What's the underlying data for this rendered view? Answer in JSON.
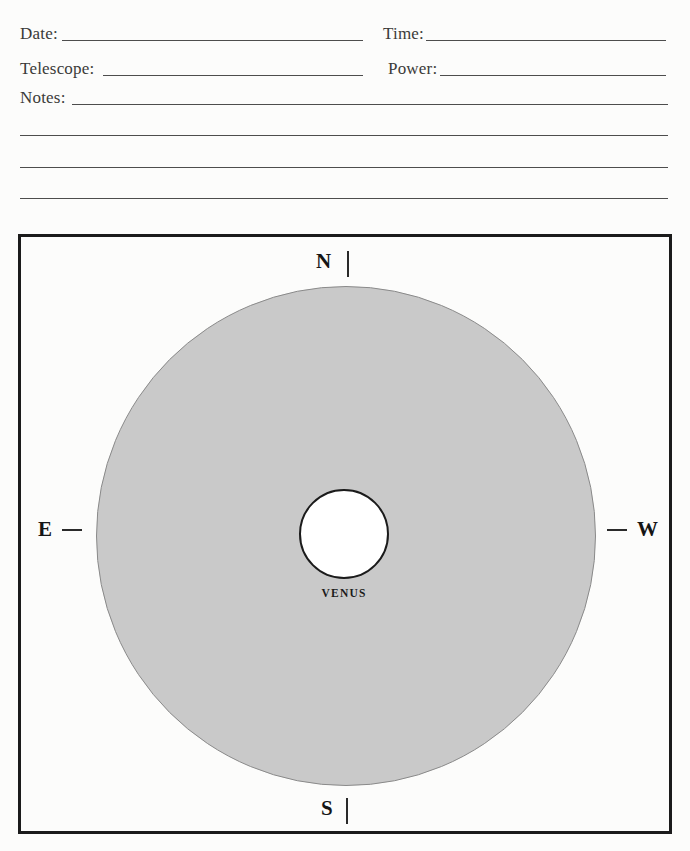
{
  "form": {
    "date": {
      "label": "Date:",
      "value": ""
    },
    "time": {
      "label": "Time:",
      "value": ""
    },
    "telescope": {
      "label": "Telescope:",
      "value": ""
    },
    "power": {
      "label": "Power:",
      "value": ""
    },
    "notes": {
      "label": "Notes:",
      "value": ""
    }
  },
  "diagram": {
    "planet_label": "VENUS",
    "compass": {
      "north": "N",
      "south": "S",
      "east": "E",
      "west": "W"
    },
    "colors": {
      "field_fill": "#c9c9c9",
      "field_outline": "#8a8a8a",
      "planet_fill": "#ffffff",
      "planet_outline": "#1b1b1b",
      "frame_outline": "#1b1b1b"
    }
  }
}
